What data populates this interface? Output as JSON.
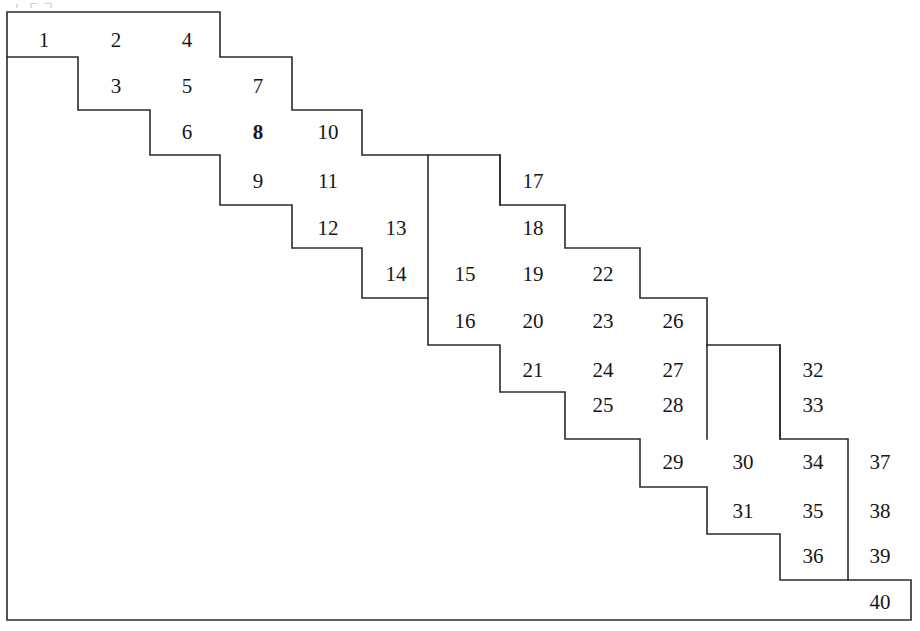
{
  "figure": {
    "title": "",
    "type": "staircase-polyomino-diagram",
    "artifact_text_top": "ㄴㄷㄱ",
    "outline_color": "#2b2b2b",
    "background_color": "#ffffff",
    "text_color": "#16171a",
    "stroke_width": 1.6,
    "grid": {
      "columns_x": [
        7,
        78,
        150,
        220,
        292,
        362,
        428,
        500,
        565,
        640,
        707,
        780,
        848,
        911
      ],
      "rows_y": [
        12,
        57,
        110,
        155,
        205,
        248,
        298,
        345,
        392,
        439,
        487,
        534,
        580,
        620
      ]
    },
    "outline_path": "M 7 12 L 220 12 L 220 57 L 292 57 L 292 110 L 362 110 L 362 155 L 500 155 L 500 205 L 565 205 L 565 248 L 640 248 L 640 298 L 707 298 L 707 345 L 780 345 L 780 439 L 848 439 L 848 580 L 911 580 L 911 620 L 7 620 Z",
    "inner_steps": [
      "M 7 57 L 78 57 L 78 110 L 150 110 L 150 155 L 220 155 L 220 205 L 292 205 L 292 248 L 362 248 L 362 298 L 428 298 L 428 345 L 500 345 L 500 392 L 565 392 L 565 439 L 640 439 L 640 487 L 707 487 L 707 534 L 780 534 L 780 580 L 848 580",
      "M 428 155 L 428 298",
      "M 500 205 L 500 155",
      "M 707 345 L 707 439",
      "M 780 345 L 780 439"
    ],
    "cells": [
      {
        "n": "1",
        "cx": 44,
        "cy": 40,
        "bold": false
      },
      {
        "n": "2",
        "cx": 116,
        "cy": 40,
        "bold": false
      },
      {
        "n": "4",
        "cx": 187,
        "cy": 40,
        "bold": false
      },
      {
        "n": "3",
        "cx": 116,
        "cy": 86,
        "bold": false
      },
      {
        "n": "5",
        "cx": 187,
        "cy": 86,
        "bold": false
      },
      {
        "n": "7",
        "cx": 258,
        "cy": 86,
        "bold": false
      },
      {
        "n": "6",
        "cx": 187,
        "cy": 132,
        "bold": false
      },
      {
        "n": "8",
        "cx": 258,
        "cy": 132,
        "bold": true
      },
      {
        "n": "10",
        "cx": 328,
        "cy": 132,
        "bold": false
      },
      {
        "n": "9",
        "cx": 258,
        "cy": 181,
        "bold": false
      },
      {
        "n": "11",
        "cx": 328,
        "cy": 181,
        "bold": false
      },
      {
        "n": "17",
        "cx": 533,
        "cy": 181,
        "bold": false
      },
      {
        "n": "12",
        "cx": 328,
        "cy": 228,
        "bold": false
      },
      {
        "n": "13",
        "cx": 396,
        "cy": 228,
        "bold": false
      },
      {
        "n": "18",
        "cx": 533,
        "cy": 228,
        "bold": false
      },
      {
        "n": "14",
        "cx": 396,
        "cy": 274,
        "bold": false
      },
      {
        "n": "15",
        "cx": 465,
        "cy": 274,
        "bold": false
      },
      {
        "n": "19",
        "cx": 533,
        "cy": 274,
        "bold": false
      },
      {
        "n": "22",
        "cx": 603,
        "cy": 274,
        "bold": false
      },
      {
        "n": "16",
        "cx": 465,
        "cy": 321,
        "bold": false
      },
      {
        "n": "20",
        "cx": 533,
        "cy": 321,
        "bold": false
      },
      {
        "n": "23",
        "cx": 603,
        "cy": 321,
        "bold": false
      },
      {
        "n": "26",
        "cx": 673,
        "cy": 321,
        "bold": false
      },
      {
        "n": "21",
        "cx": 533,
        "cy": 370,
        "bold": false
      },
      {
        "n": "24",
        "cx": 603,
        "cy": 370,
        "bold": false
      },
      {
        "n": "27",
        "cx": 673,
        "cy": 370,
        "bold": false
      },
      {
        "n": "32",
        "cx": 813,
        "cy": 370,
        "bold": false
      },
      {
        "n": "25",
        "cx": 603,
        "cy": 405,
        "bold": false
      },
      {
        "n": "28",
        "cx": 673,
        "cy": 405,
        "bold": false
      },
      {
        "n": "33",
        "cx": 813,
        "cy": 405,
        "bold": false
      },
      {
        "n": "29",
        "cx": 673,
        "cy": 462,
        "bold": false
      },
      {
        "n": "30",
        "cx": 743,
        "cy": 462,
        "bold": false
      },
      {
        "n": "34",
        "cx": 813,
        "cy": 462,
        "bold": false
      },
      {
        "n": "37",
        "cx": 880,
        "cy": 462,
        "bold": false
      },
      {
        "n": "31",
        "cx": 743,
        "cy": 511,
        "bold": false
      },
      {
        "n": "35",
        "cx": 813,
        "cy": 511,
        "bold": false
      },
      {
        "n": "38",
        "cx": 880,
        "cy": 511,
        "bold": false
      },
      {
        "n": "36",
        "cx": 813,
        "cy": 556,
        "bold": false
      },
      {
        "n": "39",
        "cx": 880,
        "cy": 556,
        "bold": false
      },
      {
        "n": "40",
        "cx": 880,
        "cy": 602,
        "bold": false
      }
    ]
  }
}
